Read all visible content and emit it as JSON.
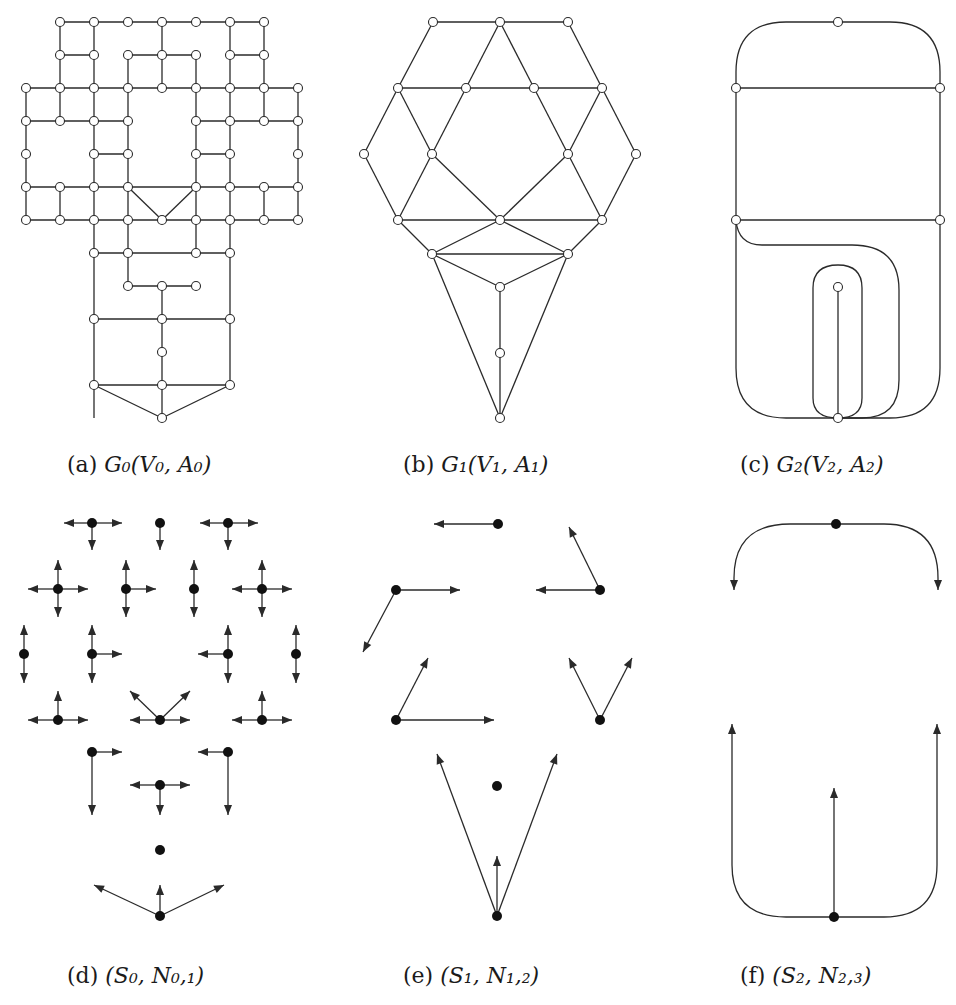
{
  "figure": {
    "stroke_color": "#2a2a2a",
    "node_fill_open": "#ffffff",
    "node_fill_solid": "#111111"
  },
  "captions": [
    {
      "id": "a",
      "tag": "(a)",
      "math": "G₀(V₀, A₀)",
      "x": 67,
      "y": 452
    },
    {
      "id": "b",
      "tag": "(b)",
      "math": "G₁(V₁, A₁)",
      "x": 403,
      "y": 452
    },
    {
      "id": "c",
      "tag": "(c)",
      "math": "G₂(V₂, A₂)",
      "x": 740,
      "y": 452
    },
    {
      "id": "d",
      "tag": "(d)",
      "math": "(S₀, N₀,₁)",
      "x": 67,
      "y": 963
    },
    {
      "id": "e",
      "tag": "(e)",
      "math": "(S₁, N₁,₂)",
      "x": 403,
      "y": 963
    },
    {
      "id": "f",
      "tag": "(f)",
      "math": "(S₂, N₂,₃)",
      "x": 740,
      "y": 963
    }
  ],
  "panels": {
    "a": {
      "name": "graph-G0",
      "nodes": [
        [
          60,
          22
        ],
        [
          94,
          22
        ],
        [
          128,
          22
        ],
        [
          162,
          22
        ],
        [
          196,
          22
        ],
        [
          230,
          22
        ],
        [
          264,
          22
        ],
        [
          60,
          55
        ],
        [
          94,
          55
        ],
        [
          128,
          55
        ],
        [
          162,
          55
        ],
        [
          196,
          55
        ],
        [
          230,
          55
        ],
        [
          264,
          55
        ],
        [
          26,
          88
        ],
        [
          60,
          88
        ],
        [
          94,
          88
        ],
        [
          128,
          88
        ],
        [
          162,
          88
        ],
        [
          196,
          88
        ],
        [
          230,
          88
        ],
        [
          264,
          88
        ],
        [
          298,
          88
        ],
        [
          26,
          121
        ],
        [
          60,
          121
        ],
        [
          94,
          121
        ],
        [
          128,
          121
        ],
        [
          196,
          121
        ],
        [
          230,
          121
        ],
        [
          264,
          121
        ],
        [
          298,
          121
        ],
        [
          26,
          154
        ],
        [
          94,
          154
        ],
        [
          128,
          154
        ],
        [
          196,
          154
        ],
        [
          230,
          154
        ],
        [
          298,
          154
        ],
        [
          26,
          187
        ],
        [
          60,
          187
        ],
        [
          94,
          187
        ],
        [
          128,
          187
        ],
        [
          196,
          187
        ],
        [
          230,
          187
        ],
        [
          264,
          187
        ],
        [
          298,
          187
        ],
        [
          26,
          220
        ],
        [
          60,
          220
        ],
        [
          94,
          220
        ],
        [
          128,
          220
        ],
        [
          162,
          220
        ],
        [
          196,
          220
        ],
        [
          230,
          220
        ],
        [
          264,
          220
        ],
        [
          298,
          220
        ],
        [
          94,
          253
        ],
        [
          128,
          253
        ],
        [
          196,
          253
        ],
        [
          230,
          253
        ],
        [
          128,
          286
        ],
        [
          162,
          286
        ],
        [
          196,
          286
        ],
        [
          94,
          319
        ],
        [
          162,
          319
        ],
        [
          230,
          319
        ],
        [
          162,
          352
        ],
        [
          94,
          385
        ],
        [
          162,
          385
        ],
        [
          230,
          385
        ],
        [
          162,
          418
        ]
      ],
      "edges": [
        [
          60,
          22,
          264,
          22
        ],
        [
          60,
          22,
          60,
          121
        ],
        [
          94,
          22,
          94,
          418
        ],
        [
          162,
          22,
          162,
          88
        ],
        [
          230,
          22,
          230,
          187
        ],
        [
          264,
          22,
          264,
          121
        ],
        [
          60,
          55,
          94,
          55
        ],
        [
          128,
          55,
          196,
          55
        ],
        [
          128,
          55,
          128,
          187
        ],
        [
          196,
          55,
          196,
          253
        ],
        [
          230,
          55,
          264,
          55
        ],
        [
          26,
          88,
          298,
          88
        ],
        [
          26,
          88,
          26,
          220
        ],
        [
          298,
          88,
          298,
          220
        ],
        [
          26,
          121,
          128,
          121
        ],
        [
          196,
          121,
          298,
          121
        ],
        [
          94,
          154,
          128,
          154
        ],
        [
          196,
          154,
          230,
          154
        ],
        [
          26,
          187,
          298,
          187
        ],
        [
          60,
          187,
          60,
          220
        ],
        [
          264,
          187,
          264,
          220
        ],
        [
          26,
          220,
          298,
          220
        ],
        [
          128,
          187,
          162,
          220
        ],
        [
          196,
          187,
          162,
          220
        ],
        [
          128,
          187,
          128,
          286
        ],
        [
          94,
          253,
          230,
          253
        ],
        [
          230,
          187,
          230,
          385
        ],
        [
          128,
          286,
          196,
          286
        ],
        [
          162,
          286,
          162,
          418
        ],
        [
          94,
          319,
          230,
          319
        ],
        [
          94,
          385,
          230,
          385
        ],
        [
          94,
          385,
          162,
          418
        ],
        [
          230,
          385,
          162,
          418
        ]
      ]
    },
    "b": {
      "name": "graph-G1",
      "nodes": [
        [
          433,
          22
        ],
        [
          500,
          22
        ],
        [
          568,
          22
        ],
        [
          398,
          88
        ],
        [
          466,
          88
        ],
        [
          534,
          88
        ],
        [
          602,
          88
        ],
        [
          364,
          154
        ],
        [
          432,
          154
        ],
        [
          568,
          154
        ],
        [
          636,
          154
        ],
        [
          398,
          220
        ],
        [
          500,
          220
        ],
        [
          602,
          220
        ],
        [
          432,
          254
        ],
        [
          568,
          254
        ],
        [
          500,
          287
        ],
        [
          500,
          353
        ],
        [
          500,
          418
        ]
      ],
      "edges": [
        [
          433,
          22,
          568,
          22
        ],
        [
          433,
          22,
          398,
          88
        ],
        [
          500,
          22,
          466,
          88
        ],
        [
          500,
          22,
          534,
          88
        ],
        [
          568,
          22,
          602,
          88
        ],
        [
          398,
          88,
          602,
          88
        ],
        [
          398,
          88,
          364,
          154
        ],
        [
          398,
          88,
          432,
          154
        ],
        [
          466,
          88,
          432,
          154
        ],
        [
          534,
          88,
          568,
          154
        ],
        [
          602,
          88,
          568,
          154
        ],
        [
          602,
          88,
          636,
          154
        ],
        [
          364,
          154,
          398,
          220
        ],
        [
          432,
          154,
          398,
          220
        ],
        [
          432,
          154,
          500,
          220
        ],
        [
          568,
          154,
          500,
          220
        ],
        [
          568,
          154,
          602,
          220
        ],
        [
          636,
          154,
          602,
          220
        ],
        [
          398,
          220,
          602,
          220
        ],
        [
          398,
          220,
          432,
          254
        ],
        [
          500,
          220,
          432,
          254
        ],
        [
          500,
          220,
          568,
          254
        ],
        [
          602,
          220,
          568,
          254
        ],
        [
          432,
          254,
          568,
          254
        ],
        [
          432,
          254,
          500,
          287
        ],
        [
          568,
          254,
          500,
          287
        ],
        [
          500,
          287,
          500,
          418
        ],
        [
          432,
          254,
          500,
          418
        ],
        [
          568,
          254,
          500,
          418
        ]
      ]
    },
    "c": {
      "name": "graph-G2",
      "nodes": [
        [
          838,
          22
        ],
        [
          736,
          88
        ],
        [
          940,
          88
        ],
        [
          736,
          220
        ],
        [
          940,
          220
        ],
        [
          838,
          287
        ],
        [
          838,
          418
        ]
      ],
      "paths": [
        "M 736 88 L 736 72 Q 736 22 786 22 L 890 22 Q 940 22 940 72 L 940 88",
        "M 736 88 L 940 88",
        "M 736 88 L 736 220",
        "M 940 88 L 940 220",
        "M 736 220 L 940 220",
        "M 736 220 L 736 368 Q 736 418 786 418 L 890 418 Q 940 418 940 368 L 940 220",
        "M 736 220 Q 738 245 762 245 L 852 245 Q 899 245 899 290 L 899 380 Q 899 418 862 418 L 838 418",
        "M 838 418 Q 813 418 813 398 L 813 288 Q 813 265 838 265 Q 862 265 862 288 L 862 398 Q 862 418 838 418",
        "M 838 287 L 838 418"
      ]
    },
    "d": {
      "name": "neighborhood-S0-N01",
      "nodes": [
        [
          92,
          523
        ],
        [
          160,
          523
        ],
        [
          228,
          523
        ],
        [
          58,
          589
        ],
        [
          126,
          589
        ],
        [
          194,
          589
        ],
        [
          262,
          589
        ],
        [
          24,
          654
        ],
        [
          92,
          654
        ],
        [
          228,
          654
        ],
        [
          296,
          654
        ],
        [
          58,
          720
        ],
        [
          160,
          720
        ],
        [
          262,
          720
        ],
        [
          92,
          752
        ],
        [
          228,
          752
        ],
        [
          160,
          785
        ],
        [
          160,
          850
        ],
        [
          160,
          916
        ]
      ],
      "arrows": [
        [
          92,
          523,
          64,
          523
        ],
        [
          92,
          523,
          122,
          523
        ],
        [
          92,
          523,
          92,
          550
        ],
        [
          160,
          523,
          160,
          550
        ],
        [
          228,
          523,
          200,
          523
        ],
        [
          228,
          523,
          258,
          523
        ],
        [
          228,
          523,
          228,
          550
        ],
        [
          58,
          589,
          58,
          560
        ],
        [
          58,
          589,
          28,
          589
        ],
        [
          58,
          589,
          88,
          589
        ],
        [
          58,
          589,
          58,
          617
        ],
        [
          126,
          589,
          126,
          560
        ],
        [
          126,
          589,
          156,
          589
        ],
        [
          126,
          589,
          126,
          617
        ],
        [
          194,
          589,
          194,
          560
        ],
        [
          194,
          589,
          194,
          617
        ],
        [
          262,
          589,
          262,
          560
        ],
        [
          262,
          589,
          232,
          589
        ],
        [
          262,
          589,
          292,
          589
        ],
        [
          262,
          589,
          262,
          617
        ],
        [
          24,
          654,
          24,
          625
        ],
        [
          24,
          654,
          24,
          683
        ],
        [
          92,
          654,
          92,
          625
        ],
        [
          92,
          654,
          122,
          654
        ],
        [
          92,
          654,
          92,
          683
        ],
        [
          228,
          654,
          228,
          625
        ],
        [
          228,
          654,
          198,
          654
        ],
        [
          228,
          654,
          228,
          683
        ],
        [
          296,
          654,
          296,
          625
        ],
        [
          296,
          654,
          296,
          683
        ],
        [
          58,
          720,
          58,
          691
        ],
        [
          58,
          720,
          28,
          720
        ],
        [
          58,
          720,
          88,
          720
        ],
        [
          160,
          720,
          130,
          720
        ],
        [
          160,
          720,
          190,
          720
        ],
        [
          160,
          720,
          130,
          691
        ],
        [
          160,
          720,
          190,
          691
        ],
        [
          262,
          720,
          262,
          691
        ],
        [
          262,
          720,
          232,
          720
        ],
        [
          262,
          720,
          292,
          720
        ],
        [
          92,
          752,
          122,
          752
        ],
        [
          92,
          752,
          92,
          815
        ],
        [
          228,
          752,
          198,
          752
        ],
        [
          228,
          752,
          228,
          815
        ],
        [
          160,
          785,
          130,
          785
        ],
        [
          160,
          785,
          190,
          785
        ],
        [
          160,
          785,
          160,
          815
        ],
        [
          160,
          916,
          160,
          885
        ],
        [
          160,
          916,
          94,
          885
        ],
        [
          160,
          916,
          224,
          885
        ]
      ]
    },
    "e": {
      "name": "neighborhood-S1-N12",
      "nodes": [
        [
          498,
          524
        ],
        [
          396,
          590
        ],
        [
          600,
          590
        ],
        [
          396,
          720
        ],
        [
          600,
          720
        ],
        [
          497,
          786
        ],
        [
          497,
          916
        ]
      ],
      "arrows": [
        [
          498,
          524,
          434,
          524
        ],
        [
          396,
          590,
          460,
          590
        ],
        [
          396,
          590,
          363,
          652
        ],
        [
          600,
          590,
          536,
          590
        ],
        [
          600,
          590,
          569,
          527
        ],
        [
          396,
          720,
          494,
          720
        ],
        [
          396,
          720,
          428,
          658
        ],
        [
          600,
          720,
          569,
          658
        ],
        [
          600,
          720,
          632,
          658
        ],
        [
          497,
          916,
          437,
          754
        ],
        [
          497,
          916,
          557,
          754
        ],
        [
          497,
          916,
          497,
          856
        ]
      ]
    },
    "f": {
      "name": "neighborhood-S2-N23",
      "nodes": [
        [
          836,
          524
        ],
        [
          834,
          917
        ]
      ],
      "arrow_paths": [
        {
          "d": "M 836 524 L 790 524 Q 734 524 734 578 L 734 590",
          "tip": [
            734,
            590,
            "down"
          ]
        },
        {
          "d": "M 836 524 L 884 524 Q 938 524 938 578 L 938 590",
          "tip": [
            938,
            590,
            "down"
          ]
        },
        {
          "d": "M 834 917 L 786 917 Q 732 917 732 865 L 732 724",
          "tip": [
            732,
            724,
            "up"
          ]
        },
        {
          "d": "M 834 917 L 884 917 Q 937 917 937 865 L 937 724",
          "tip": [
            937,
            724,
            "up"
          ]
        },
        {
          "d": "M 834 917 L 834 788",
          "tip": [
            834,
            788,
            "up"
          ]
        }
      ]
    }
  }
}
